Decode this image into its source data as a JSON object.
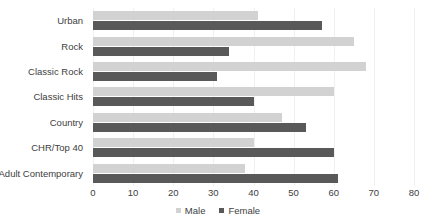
{
  "chart_data": {
    "type": "bar",
    "orientation": "horizontal",
    "title": "",
    "xlabel": "",
    "ylabel": "",
    "xlim": [
      0,
      80
    ],
    "xticks": [
      0,
      10,
      20,
      30,
      40,
      50,
      60,
      70,
      80
    ],
    "grid": true,
    "legend_position": "bottom",
    "categories": [
      "Urban",
      "Rock",
      "Classic Rock",
      "Classic Hits",
      "Country",
      "CHR/Top 40",
      "Adult Contemporary"
    ],
    "series": [
      {
        "name": "Male",
        "color": "#d2d2d2",
        "values": [
          41,
          65,
          68,
          60,
          47,
          40,
          38
        ]
      },
      {
        "name": "Female",
        "color": "#595959",
        "values": [
          57,
          34,
          31,
          40,
          53,
          60,
          61
        ]
      }
    ]
  },
  "legend": {
    "items": [
      {
        "label": "Male",
        "swatch": "male-swatch"
      },
      {
        "label": "Female",
        "swatch": "female-swatch"
      }
    ]
  }
}
